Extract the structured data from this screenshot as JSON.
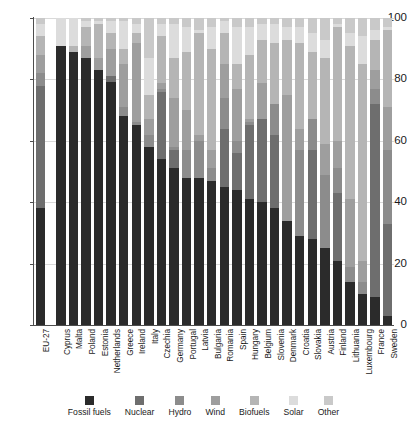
{
  "chart_data": {
    "type": "bar",
    "subtype": "stacked-percentage",
    "title": "",
    "xlabel": "",
    "ylabel": "",
    "ylim": [
      0,
      100
    ],
    "yticks": [
      0,
      20,
      40,
      60,
      80,
      100
    ],
    "ytick_labels": [
      "0",
      "20",
      "40",
      "60",
      "80",
      "100"
    ],
    "grid": true,
    "grid_axis": "y",
    "legend_position": "bottom",
    "categories": [
      "EU-27",
      "Cyprus",
      "Malta",
      "Poland",
      "Estonia",
      "Netherlands",
      "Greece",
      "Ireland",
      "Italy",
      "Czechia",
      "Germany",
      "Portugal",
      "Latvia",
      "Bulgaria",
      "Romania",
      "Spain",
      "Hungary",
      "Belgium",
      "Slovenia",
      "Denmark",
      "Croatia",
      "Slovakia",
      "Austria",
      "Finland",
      "Lithuania",
      "Luxembourg",
      "France",
      "Sweden"
    ],
    "series": [
      {
        "name": "Fossil fuels",
        "color": "#2b2b2b",
        "values": [
          38,
          91,
          89,
          87,
          83,
          79,
          68,
          65,
          58,
          54,
          51,
          48,
          48,
          47,
          45,
          44,
          41,
          40,
          38,
          34,
          29,
          28,
          25,
          21,
          14,
          10,
          9,
          3
        ]
      },
      {
        "name": "Nuclear",
        "color": "#6e6e6e",
        "values": [
          40,
          0,
          0,
          0,
          0,
          2,
          0,
          0,
          0,
          22,
          6,
          0,
          0,
          0,
          19,
          12,
          24,
          27,
          24,
          0,
          0,
          29,
          0,
          22,
          0,
          0,
          63,
          30
        ]
      },
      {
        "name": "Hydro",
        "color": "#8c8c8c",
        "values": [
          4,
          0,
          0,
          0,
          0,
          0,
          3,
          1,
          4,
          1,
          1,
          9,
          12,
          4,
          10,
          4,
          1,
          0,
          10,
          0,
          28,
          10,
          24,
          8,
          5,
          4,
          5,
          24
        ]
      },
      {
        "name": "Wind",
        "color": "#9e9e9e",
        "values": [
          6,
          0,
          0,
          4,
          4,
          9,
          14,
          26,
          5,
          2,
          16,
          13,
          2,
          6,
          11,
          17,
          1,
          12,
          0,
          41,
          7,
          0,
          10,
          9,
          22,
          7,
          6,
          14
        ]
      },
      {
        "name": "Biofuels",
        "color": "#b5b5b5",
        "values": [
          6,
          0,
          2,
          6,
          11,
          5,
          5,
          3,
          8,
          15,
          13,
          19,
          33,
          33,
          10,
          8,
          21,
          14,
          20,
          18,
          28,
          22,
          28,
          37,
          50,
          64,
          10,
          25
        ]
      },
      {
        "name": "Solar",
        "color": "#dcdcdc",
        "values": [
          4,
          9,
          9,
          2,
          1,
          4,
          9,
          3,
          12,
          4,
          11,
          8,
          1,
          7,
          4,
          12,
          9,
          5,
          6,
          4,
          5,
          6,
          6,
          1,
          4,
          9,
          3,
          1
        ]
      },
      {
        "name": "Other",
        "color": "#c9c9c9",
        "values": [
          2,
          0,
          0,
          1,
          1,
          1,
          1,
          2,
          13,
          2,
          2,
          3,
          4,
          3,
          1,
          3,
          3,
          2,
          2,
          3,
          3,
          5,
          7,
          2,
          5,
          6,
          4,
          3
        ]
      }
    ]
  }
}
